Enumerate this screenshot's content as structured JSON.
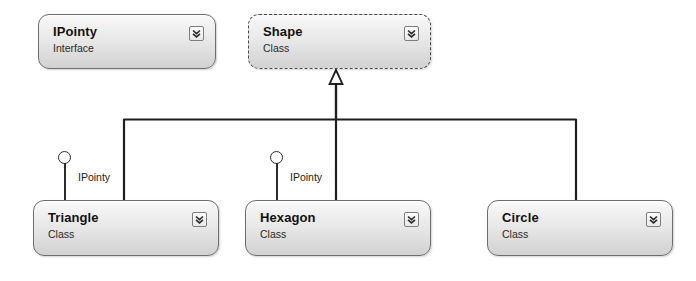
{
  "diagram": {
    "kind": "uml-class-diagram",
    "background_color": "#ffffff",
    "width": 696,
    "height": 281
  },
  "nodes": [
    {
      "id": "ipointy",
      "title": "IPointy",
      "stereotype": "Interface",
      "selected": false,
      "expander_icon": "chevron-double-down-icon",
      "x": 38,
      "y": 14,
      "w": 178,
      "h": 55
    },
    {
      "id": "shape",
      "title": "Shape",
      "stereotype": "Class",
      "selected": true,
      "expander_icon": "chevron-double-down-icon",
      "x": 248,
      "y": 14,
      "w": 183,
      "h": 55
    },
    {
      "id": "triangle",
      "title": "Triangle",
      "stereotype": "Class",
      "selected": false,
      "expander_icon": "chevron-double-down-icon",
      "x": 33,
      "y": 200,
      "w": 186,
      "h": 56
    },
    {
      "id": "hexagon",
      "title": "Hexagon",
      "stereotype": "Class",
      "selected": false,
      "expander_icon": "chevron-double-down-icon",
      "x": 245,
      "y": 200,
      "w": 186,
      "h": 56
    },
    {
      "id": "circle",
      "title": "Circle",
      "stereotype": "Class",
      "selected": false,
      "expander_icon": "chevron-double-down-icon",
      "x": 487,
      "y": 200,
      "w": 186,
      "h": 56
    }
  ],
  "lollipops": [
    {
      "id": "triangle-ipointy",
      "label": "IPointy",
      "x": 58,
      "y": 151,
      "stem_height": 49
    },
    {
      "id": "hexagon-ipointy",
      "label": "IPointy",
      "x": 270,
      "y": 151,
      "stem_height": 49
    }
  ],
  "generalization": {
    "relation": "inheritance",
    "target": "Shape",
    "sources": [
      "Triangle",
      "Hexagon",
      "Circle"
    ],
    "arrowhead": "hollow-triangle",
    "line_color": "#1e1e1e"
  },
  "colors": {
    "node_border": "#6e6e6e",
    "node_fill_top": "#fbfbfb",
    "node_fill_bottom": "#d2d2d2",
    "text": "#14120f",
    "connector": "#1e1e1e"
  }
}
